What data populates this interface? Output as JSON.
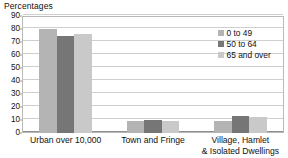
{
  "chart_data": {
    "type": "bar",
    "title": "",
    "subtitle": "",
    "xlabel": "",
    "ylabel": "Percentages",
    "ylim": [
      0,
      90
    ],
    "ytick_step": 10,
    "yticks": [
      90,
      80,
      70,
      60,
      50,
      40,
      30,
      20,
      10,
      0
    ],
    "grid": true,
    "legend_position": "top-right-inside",
    "categories": [
      "Urban over 10,000",
      "Town and Fringe",
      "Village, Hamlet & Isolated Dwellings"
    ],
    "category_lines": [
      [
        "Urban over 10,000"
      ],
      [
        "Town and Fringe"
      ],
      [
        "Village, Hamlet",
        "& Isolated Dwellings"
      ]
    ],
    "series": [
      {
        "name": "0 to 49",
        "color": "#b4b4b4",
        "values": [
          80,
          9.5,
          9
        ]
      },
      {
        "name": "50 to 64",
        "color": "#767676",
        "values": [
          75,
          10,
          13
        ]
      },
      {
        "name": "65 and over",
        "color": "#c9c9c9",
        "values": [
          76,
          9,
          12
        ]
      }
    ]
  },
  "colors": {
    "plot_border": "#b9b9b9",
    "gridline": "#cfcfcf",
    "baseline": "#8f8f8f",
    "text": "#111111",
    "background": "#ffffff"
  }
}
